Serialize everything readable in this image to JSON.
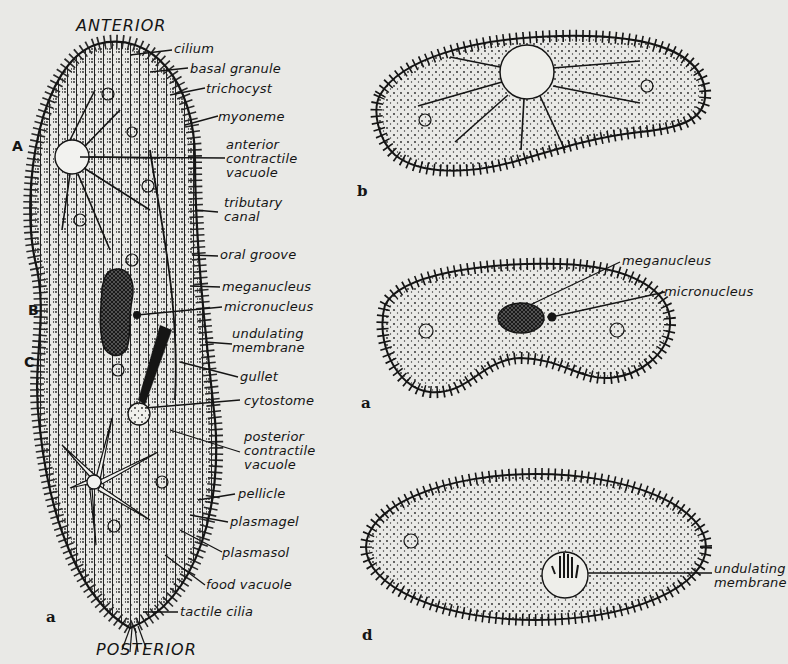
{
  "main_figure": {
    "top_label": "ANTERIOR",
    "bottom_label": "POSTERIOR",
    "figure_letter": "a",
    "region_markers": [
      "A",
      "B",
      "C"
    ],
    "labels": [
      {
        "id": "cilium",
        "text": "cilium"
      },
      {
        "id": "basal_granule",
        "text": "basal granule"
      },
      {
        "id": "trichocyst",
        "text": "trichocyst"
      },
      {
        "id": "myoneme",
        "text": "myoneme"
      },
      {
        "id": "anterior_contractile_vacuole",
        "lines": [
          "anterior",
          "contractile",
          "vacuole"
        ]
      },
      {
        "id": "tributary_canal",
        "lines": [
          "tributary",
          "canal"
        ]
      },
      {
        "id": "oral_groove",
        "text": "oral groove"
      },
      {
        "id": "meganucleus",
        "text": "meganucleus"
      },
      {
        "id": "micronucleus",
        "text": "micronucleus"
      },
      {
        "id": "undulating_membrane",
        "lines": [
          "undulating",
          "membrane"
        ]
      },
      {
        "id": "gullet",
        "text": "gullet"
      },
      {
        "id": "cytostome",
        "text": "cytostome"
      },
      {
        "id": "posterior_contractile_vacuole",
        "lines": [
          "posterior",
          "contractile",
          "vacuole"
        ]
      },
      {
        "id": "pellicle",
        "text": "pellicle"
      },
      {
        "id": "plasmagel",
        "text": "plasmagel"
      },
      {
        "id": "plasmasol",
        "text": "plasmasol"
      },
      {
        "id": "food_vacuole",
        "text": "food vacuole"
      },
      {
        "id": "tactile_cilia",
        "text": "tactile cilia"
      }
    ]
  },
  "figure_b": {
    "letter": "b"
  },
  "figure_c": {
    "letter": "a",
    "labels": [
      {
        "id": "meganucleus",
        "text": "meganucleus"
      },
      {
        "id": "micronucleus",
        "text": "micronucleus"
      }
    ]
  },
  "figure_d": {
    "letter": "d",
    "labels": [
      {
        "id": "undulating_membrane",
        "lines": [
          "undulating",
          "membrane"
        ]
      }
    ]
  },
  "colors": {
    "ink": "#151515",
    "paper": "#e9e9e6"
  }
}
